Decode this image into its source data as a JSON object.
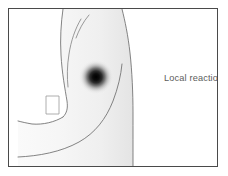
{
  "figure": {
    "title_label": "Local reaction",
    "kind": "medical-illustration",
    "frame": {
      "border_color": "#4a4a4a",
      "background_color": "#ffffff"
    },
    "arm": {
      "fill_color_light": "#f7f7f7",
      "fill_color_shaded": "#e8e8e8",
      "outline_color": "#6e6e6e",
      "contour_line_color": "#7a7a7a"
    },
    "reaction_spot": {
      "label": "Local reaction",
      "center_x": 95,
      "center_y": 76,
      "radius": 17,
      "core_color": "#000000",
      "edge_color": "#ffffff"
    },
    "sleeve_cuff": {
      "outline_color": "#8a8a8a"
    }
  }
}
